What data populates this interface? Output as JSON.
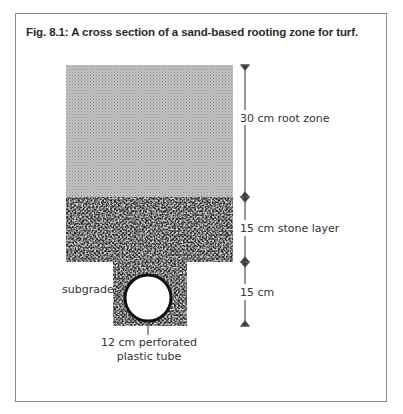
{
  "figure": {
    "title": "Fig. 8.1: A cross section of a sand-based rooting zone for turf.",
    "layers": [
      {
        "name": "root zone",
        "label": "30 cm root zone",
        "thickness_cm": 30,
        "fill": "#b4b4b4",
        "pattern": "fine-checker"
      },
      {
        "name": "stone layer",
        "label": "15 cm stone layer",
        "thickness_cm": 15,
        "fill": "#6a6a6a",
        "pattern": "coarse-gravel"
      },
      {
        "name": "drain trench",
        "label": "15 cm",
        "thickness_cm": 15,
        "fill": "#6a6a6a",
        "pattern": "coarse-gravel"
      }
    ],
    "labels": {
      "root_zone": "30 cm root zone",
      "stone_layer": "15 cm stone layer",
      "trench": "15 cm",
      "subgrade": "subgrade",
      "tube_line1": "12 cm perforated",
      "tube_line2": "plastic tube"
    },
    "tube": {
      "diameter_cm": 12,
      "type": "perforated plastic tube"
    },
    "colors": {
      "frame": "#8a8a8a",
      "root_zone": "#b4b4b4",
      "stone": "#5a5a5a",
      "arrow": "#555555"
    }
  }
}
